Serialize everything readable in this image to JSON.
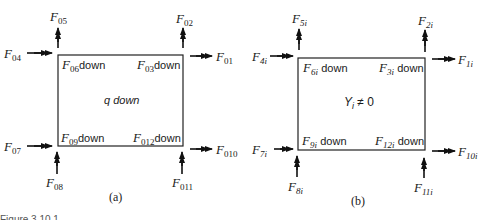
{
  "panels": [
    {
      "id": "a",
      "caption": "(a)",
      "center_text": "q down",
      "inner_labels": {
        "top_left": {
          "base": "F",
          "sub": "06",
          "suffix": "down"
        },
        "top_right": {
          "base": "F",
          "sub": "03",
          "suffix": "down"
        },
        "bottom_left": {
          "base": "F",
          "sub": "09",
          "suffix": "down"
        },
        "bottom_right": {
          "base": "F",
          "sub": "012",
          "suffix": "down"
        }
      },
      "arrows": {
        "top_left_up": {
          "base": "F",
          "sub": "05"
        },
        "top_left_in": {
          "base": "F",
          "sub": "04"
        },
        "top_right_up": {
          "base": "F",
          "sub": "02"
        },
        "top_right_out": {
          "base": "F",
          "sub": "01"
        },
        "bottom_left_in": {
          "base": "F",
          "sub": "07"
        },
        "bottom_left_up": {
          "base": "F",
          "sub": "08"
        },
        "bottom_right_out": {
          "base": "F",
          "sub": "010"
        },
        "bottom_right_up": {
          "base": "F",
          "sub": "011"
        }
      }
    },
    {
      "id": "b",
      "caption": "(b)",
      "center_text": "Y",
      "center_sub": "i",
      "center_rel": "≠ 0",
      "inner_labels": {
        "top_left": {
          "base": "F",
          "sub": "6i",
          "suffix": "down"
        },
        "top_right": {
          "base": "F",
          "sub": "3i",
          "suffix": "down"
        },
        "bottom_left": {
          "base": "F",
          "sub": "9i",
          "suffix": "down"
        },
        "bottom_right": {
          "base": "F",
          "sub": "12i",
          "suffix": "down"
        }
      },
      "arrows": {
        "top_left_up": {
          "base": "F",
          "sub": "5i"
        },
        "top_left_in": {
          "base": "F",
          "sub": "4i"
        },
        "top_right_up": {
          "base": "F",
          "sub": "2i"
        },
        "top_right_out": {
          "base": "F",
          "sub": "1i"
        },
        "bottom_left_in": {
          "base": "F",
          "sub": "7i"
        },
        "bottom_left_up": {
          "base": "F",
          "sub": "8i"
        },
        "bottom_right_out": {
          "base": "F",
          "sub": "10i"
        },
        "bottom_right_up": {
          "base": "F",
          "sub": "11i"
        }
      }
    }
  ],
  "figure_caption_fragment": "Figure 3.10.1"
}
